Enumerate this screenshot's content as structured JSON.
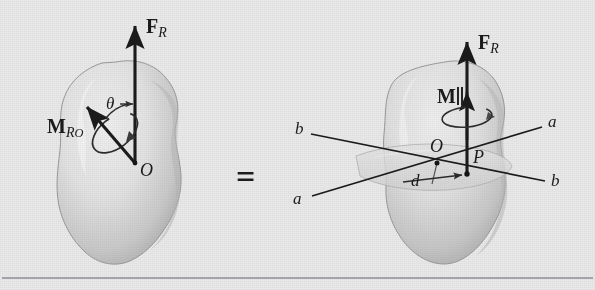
{
  "figure": {
    "equals_symbol": "=",
    "background_color": "#e9e9e9",
    "ink_color": "#1b1b1b",
    "rule_color": "#8f8f98"
  },
  "left_diagram": {
    "name": "force-and-couple-moment-at-O",
    "body_label": "rigid-body-blob",
    "force": {
      "symbol": "F",
      "subscript": "R",
      "direction": "up",
      "applied_at": "O"
    },
    "moment": {
      "symbol": "M",
      "subscript": "RO",
      "subscript_main": "R",
      "subscript_second": "O",
      "direction": "up-left"
    },
    "angle": {
      "symbol": "θ"
    },
    "point": {
      "label": "O"
    }
  },
  "right_diagram": {
    "name": "wrench-at-P",
    "body_label": "rigid-body-blob",
    "force": {
      "symbol": "F",
      "subscript": "R",
      "direction": "up",
      "applied_at": "P"
    },
    "moment": {
      "symbol": "M",
      "direction": "up",
      "arrow_style": "double-headed"
    },
    "points": [
      {
        "label": "O"
      },
      {
        "label": "P"
      }
    ],
    "distance": {
      "symbol": "d"
    },
    "axes": [
      {
        "label": "a",
        "position": "left-lower"
      },
      {
        "label": "a",
        "position": "right-upper"
      },
      {
        "label": "b",
        "position": "left-upper"
      },
      {
        "label": "b",
        "position": "right-lower"
      }
    ]
  }
}
